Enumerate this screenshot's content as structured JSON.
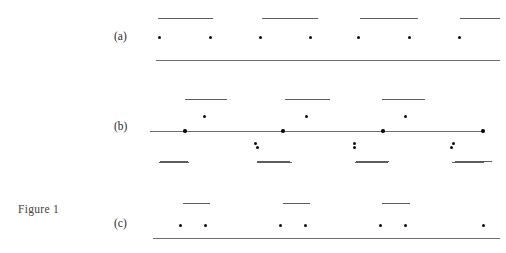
{
  "figure": {
    "caption": "Figure 1",
    "caption_x": 18,
    "caption_y": 203,
    "width": 506,
    "height": 253,
    "background_color": "#ffffff",
    "line_color": "#6e6e6e",
    "dash_color": "#5c5c5c",
    "dot_color": "#0d0d0d",
    "label_color": "#2b2b2b"
  },
  "chart_data": {
    "type": "scatter",
    "title": "Figure 1",
    "xlabel": "",
    "ylabel": "",
    "grid": false,
    "legend": "none",
    "panels": [
      {
        "id": "a",
        "label": "(a)",
        "label_x": 114,
        "label_y": 38,
        "baseline": {
          "x1": 156,
          "x2": 500,
          "y": 60
        },
        "dash_y": 18,
        "dashes": [
          {
            "x1": 158,
            "x2": 213
          },
          {
            "x1": 262,
            "x2": 318
          },
          {
            "x1": 360,
            "x2": 418
          },
          {
            "x1": 460,
            "x2": 500
          }
        ],
        "dot_y": 38,
        "dots_x": [
          160,
          211,
          261,
          311,
          359,
          410,
          460
        ]
      },
      {
        "id": "b",
        "label": "(b)",
        "label_x": 114,
        "label_y": 128,
        "baseline": {
          "x1": 150,
          "x2": 484,
          "y": 131
        },
        "dash_above_y": 99,
        "dashes_above": [
          {
            "x1": 185,
            "x2": 227
          },
          {
            "x1": 285,
            "x2": 330
          },
          {
            "x1": 382,
            "x2": 425
          }
        ],
        "dots_above_y": 117,
        "dots_above_x": [
          205,
          307,
          406
        ],
        "dots_on_line_x": [
          185,
          283,
          383,
          483
        ],
        "dots_below_y": 148,
        "dots_below_x": [
          258,
          355,
          452
        ],
        "dash_below_y": 162,
        "dashes_below": [
          {
            "x1": 159,
            "x2": 189
          },
          {
            "x1": 257,
            "x2": 292
          },
          {
            "x1": 355,
            "x2": 388
          },
          {
            "x1": 452,
            "x2": 484
          }
        ]
      },
      {
        "id": "c",
        "label": "(c)",
        "label_x": 114,
        "label_y": 225,
        "baseline": {
          "x1": 153,
          "x2": 500,
          "y": 238
        },
        "dots_upper_y": 144,
        "dots_upper_x": [
          256,
          355,
          454
        ],
        "dash_upper_y": 161,
        "dashes_upper": [
          {
            "x1": 160,
            "x2": 188
          },
          {
            "x1": 257,
            "x2": 290
          },
          {
            "x1": 356,
            "x2": 389
          },
          {
            "x1": 455,
            "x2": 492
          }
        ],
        "dash_lower_y": 203,
        "dashes_lower": [
          {
            "x1": 183,
            "x2": 210
          },
          {
            "x1": 283,
            "x2": 310
          },
          {
            "x1": 382,
            "x2": 410
          }
        ],
        "dots_lower_y": 226,
        "dots_lower_x": [
          181,
          206,
          281,
          306,
          381,
          406,
          484
        ]
      }
    ]
  }
}
